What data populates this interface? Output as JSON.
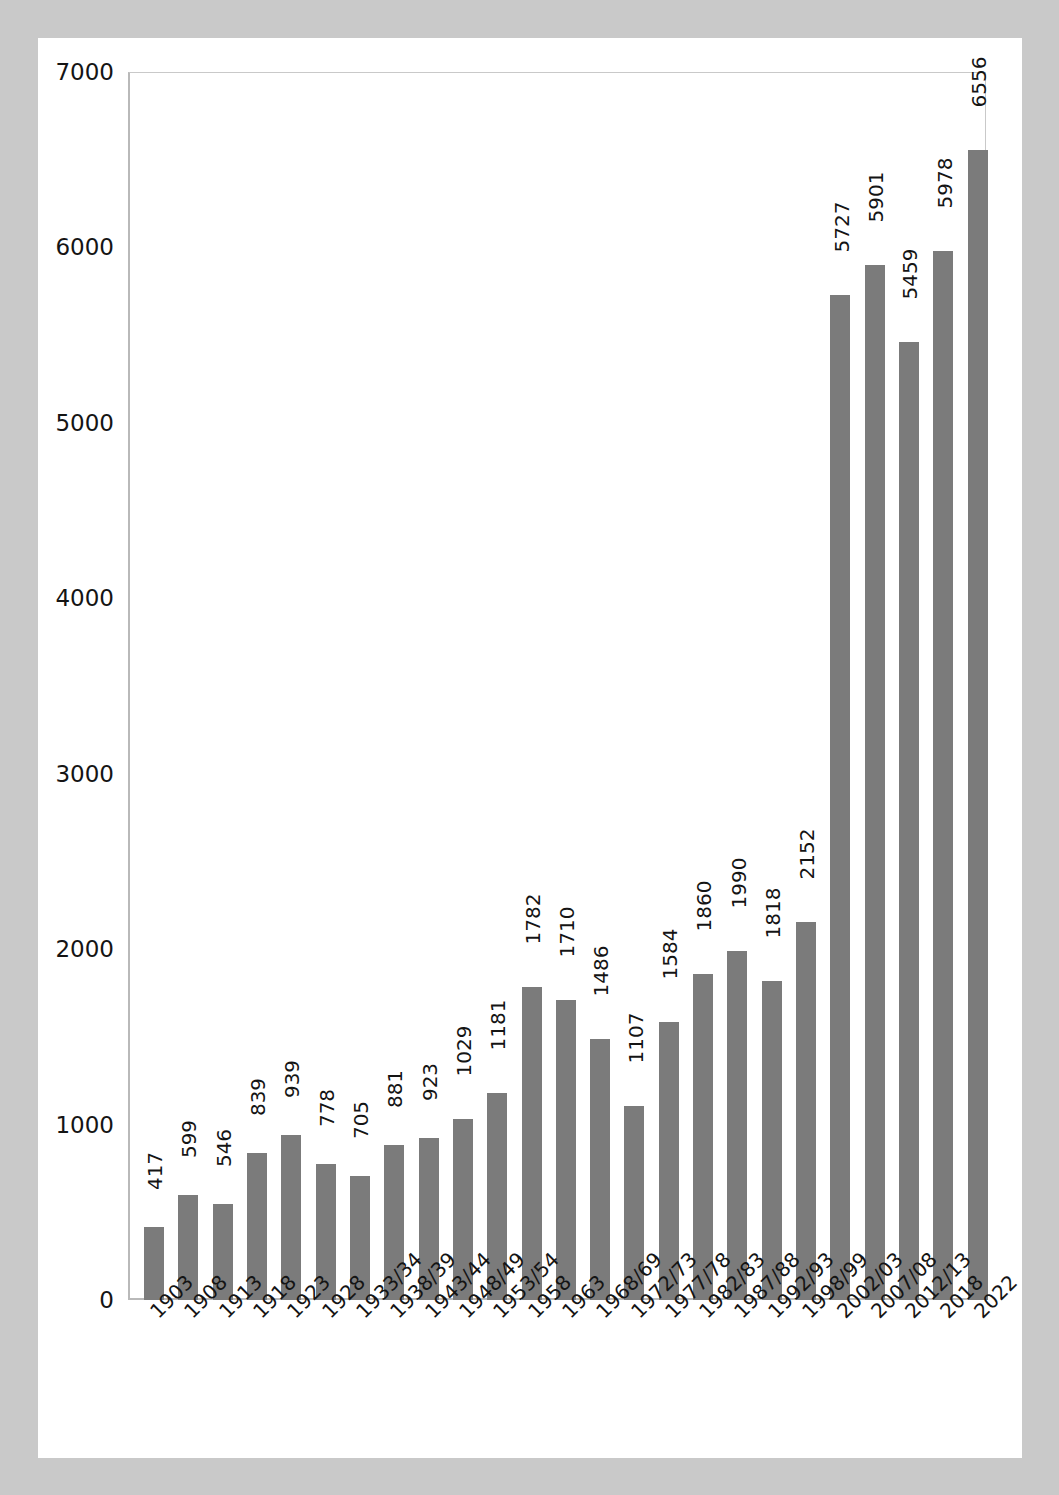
{
  "chart_data": {
    "type": "bar",
    "title": "",
    "subtitle": "",
    "xlabel": "",
    "ylabel": "",
    "ylim": [
      0,
      7000
    ],
    "ytick_labels": [
      "0",
      "1000",
      "2000",
      "3000",
      "4000",
      "5000",
      "6000",
      "7000"
    ],
    "yticks": [
      0,
      1000,
      2000,
      3000,
      4000,
      5000,
      6000,
      7000
    ],
    "grid": false,
    "legend": "none",
    "bar_color": "#7b7b7b",
    "value_labels_rotated": true,
    "categories": [
      "1903",
      "1908",
      "1913",
      "1918",
      "1923",
      "1928",
      "1933/34",
      "1938/39",
      "1943/44",
      "1948/49",
      "1953/54",
      "1958",
      "1963",
      "1968/69",
      "1972/73",
      "1977/78",
      "1982/83",
      "1987/88",
      "1992/93",
      "1998/99",
      "2002/03",
      "2007/08",
      "2012/13",
      "2018",
      "2022"
    ],
    "values": [
      417,
      599,
      546,
      839,
      939,
      778,
      705,
      881,
      923,
      1029,
      1181,
      1782,
      1710,
      1486,
      1107,
      1584,
      1860,
      1990,
      1818,
      2152,
      5727,
      5901,
      5459,
      5978,
      6556
    ]
  },
  "page": {
    "background_color": "#c9c9c9",
    "canvas_color": "#ffffff"
  }
}
